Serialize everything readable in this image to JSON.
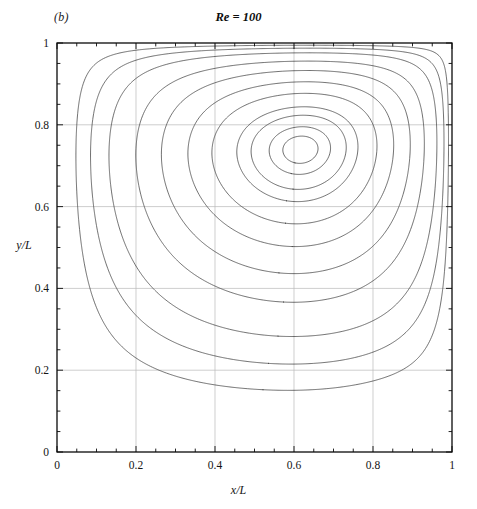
{
  "figure": {
    "panel_label": "(b)",
    "title": "Re = 100",
    "background_color": "#ffffff",
    "contour_color": "#3c3c3c",
    "frame_color": "#0a0a0a",
    "grid_color": "#b9b9b9"
  },
  "axes": {
    "x_title": "x/L",
    "y_title": "y/L",
    "x_ticks": [
      "0",
      "0.2",
      "0.4",
      "0.6",
      "0.8",
      "1"
    ],
    "y_ticks": [
      "0",
      "0.2",
      "0.4",
      "0.6",
      "0.8",
      "1"
    ],
    "x_tick_values": [
      0,
      0.2,
      0.4,
      0.6,
      0.8,
      1
    ],
    "y_tick_values": [
      0,
      0.2,
      0.4,
      0.6,
      0.8,
      1
    ],
    "x_minor_step": 0.05,
    "y_minor_step": 0.05,
    "xlim": [
      0,
      1
    ],
    "ylim": [
      0,
      1
    ],
    "grid": true,
    "tick_direction": "in",
    "frame": "box"
  },
  "chart_data": {
    "type": "line",
    "subtype": "contour",
    "title": "Re = 100",
    "panel": "(b)",
    "xlabel": "x/L",
    "ylabel": "y/L",
    "xlim": [
      0,
      1
    ],
    "ylim": [
      0,
      1
    ],
    "grid": true,
    "legend": "none",
    "reynolds_number": 100,
    "primary_vortex_center": {
      "x": 0.617,
      "y": 0.74
    },
    "secondary_eddies": [
      {
        "name": "bottom-right-eddy",
        "center": {
          "x": 0.94,
          "y": 0.06
        },
        "loops": 2
      }
    ],
    "contour_levels": [
      -0.1175,
      -0.115,
      -0.11,
      -0.1,
      -0.09,
      -0.07,
      -0.05,
      -0.03,
      -0.015,
      -0.005,
      -0.0015,
      -0.0003,
      2e-05,
      0.00015
    ],
    "contour_count": 14,
    "series": [
      {
        "name": "streamfunction contours",
        "values": [
          -0.1175,
          -0.115,
          -0.11,
          -0.1,
          -0.09,
          -0.07,
          -0.05,
          -0.03,
          -0.015,
          -0.005,
          -0.0015,
          -0.0003,
          2e-05,
          0.00015
        ]
      }
    ]
  }
}
